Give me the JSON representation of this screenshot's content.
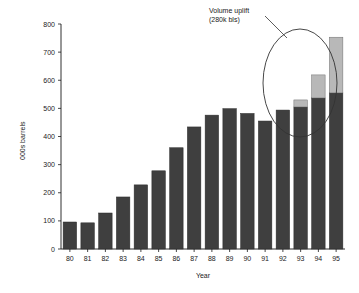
{
  "chart_data": {
    "type": "bar",
    "title": "",
    "subtitle": "",
    "xlabel": "Year",
    "ylabel": "000s barrels",
    "categories": [
      "80",
      "81",
      "82",
      "83",
      "84",
      "85",
      "86",
      "87",
      "88",
      "89",
      "90",
      "91",
      "92",
      "93",
      "94",
      "95"
    ],
    "ylim": [
      0,
      800
    ],
    "yticks": [
      0,
      100,
      200,
      300,
      400,
      500,
      600,
      700,
      800
    ],
    "ytick_labels": [
      "0",
      "100",
      "200",
      "300",
      "400",
      "500",
      "600",
      "700",
      "800"
    ],
    "grid": false,
    "legend_position": "none",
    "stacked": true,
    "series": [
      {
        "name": "Base volume",
        "color": "#3f3f3f",
        "values": [
          96,
          93,
          128,
          185,
          228,
          278,
          360,
          434,
          476,
          499,
          482,
          455,
          494,
          505,
          537,
          555
        ]
      },
      {
        "name": "Volume uplift",
        "color": "#b8b8b8",
        "values": [
          0,
          0,
          0,
          0,
          0,
          0,
          0,
          0,
          0,
          0,
          0,
          0,
          0,
          25,
          82,
          198
        ]
      }
    ],
    "totals": [
      96,
      93,
      128,
      185,
      228,
      278,
      360,
      434,
      476,
      499,
      482,
      455,
      494,
      530,
      619,
      753
    ],
    "annotations": [
      {
        "name": "volume-uplift-callout",
        "line1": "Volume uplift",
        "line2": "(280k bls)",
        "points_to": "stacked light segments for years 93, 94, 95"
      }
    ]
  },
  "axis": {
    "y_title": "000s barrels",
    "x_title": "Year"
  },
  "colors": {
    "base_bar": "#3f3f3f",
    "uplift_bar": "#b8b8b8",
    "axis": "#1a1a1a",
    "background": "#ffffff",
    "annotation_stroke": "#333333"
  }
}
